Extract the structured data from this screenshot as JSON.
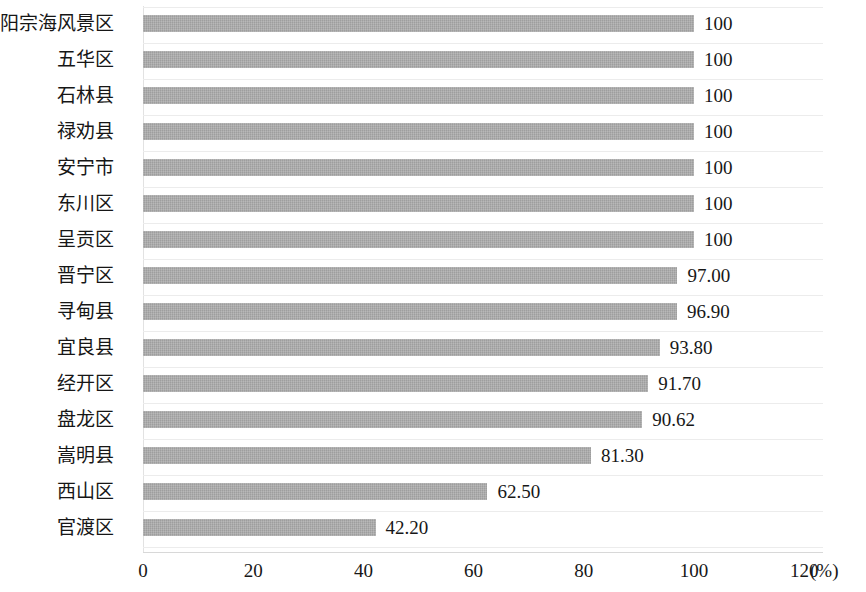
{
  "chart_data": {
    "type": "bar",
    "orientation": "horizontal",
    "title": "",
    "xlabel": "(%)",
    "ylabel": "",
    "xlim": [
      0,
      120
    ],
    "x_ticks": [
      "0",
      "20",
      "40",
      "60",
      "80",
      "100",
      "120"
    ],
    "x_tick_values": [
      0,
      20,
      40,
      60,
      80,
      100,
      120
    ],
    "unit": "(%)",
    "grid": "horizontal",
    "legend": "none",
    "bar_color": "#a9a9a9",
    "categories": [
      "阳宗海风景区",
      "五华区",
      "石林县",
      "禄劝县",
      "安宁市",
      "东川区",
      "呈贡区",
      "晋宁区",
      "寻甸县",
      "宜良县",
      "经开区",
      "盘龙区",
      "嵩明县",
      "西山区",
      "官渡区"
    ],
    "values": [
      100,
      100,
      100,
      100,
      100,
      100,
      100,
      97.0,
      96.9,
      93.8,
      91.7,
      90.62,
      81.3,
      62.5,
      42.2
    ],
    "value_labels": [
      "100",
      "100",
      "100",
      "100",
      "100",
      "100",
      "100",
      "97.00",
      "96.90",
      "93.80",
      "91.70",
      "90.62",
      "81.30",
      "62.50",
      "42.20"
    ]
  }
}
